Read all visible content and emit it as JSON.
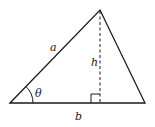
{
  "diagram": {
    "type": "triangle",
    "labels": {
      "side_a": "a",
      "side_b": "b",
      "height": "h",
      "angle": "θ"
    },
    "colors": {
      "stroke": "#1a1a1a",
      "background": "#ffffff"
    }
  }
}
